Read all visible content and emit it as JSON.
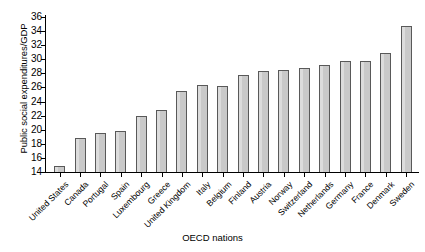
{
  "chart_data": {
    "type": "bar",
    "title": "",
    "xlabel": "OECD nations",
    "ylabel": "Public social expenditures/GDP",
    "ylim": [
      14,
      36
    ],
    "ytick_step": 2,
    "yticks": [
      14,
      16,
      18,
      20,
      22,
      24,
      26,
      28,
      30,
      32,
      34,
      36
    ],
    "grid": false,
    "legend": null,
    "bar_color": "#c9c9c9",
    "bar_edge_color": "#595959",
    "categories": [
      "United States",
      "Canada",
      "Portugal",
      "Spain",
      "Luxembourg",
      "Greece",
      "United Kingdom",
      "Italy",
      "Belgium",
      "Finland",
      "Austria",
      "Norway",
      "Switzerland",
      "Netherlands",
      "Germany",
      "France",
      "Denmark",
      "Sweden"
    ],
    "values": [
      14.9,
      18.8,
      19.6,
      19.8,
      22.0,
      22.8,
      25.5,
      26.4,
      26.2,
      27.7,
      28.4,
      28.5,
      28.8,
      29.2,
      29.7,
      29.8,
      30.9,
      34.7
    ]
  }
}
